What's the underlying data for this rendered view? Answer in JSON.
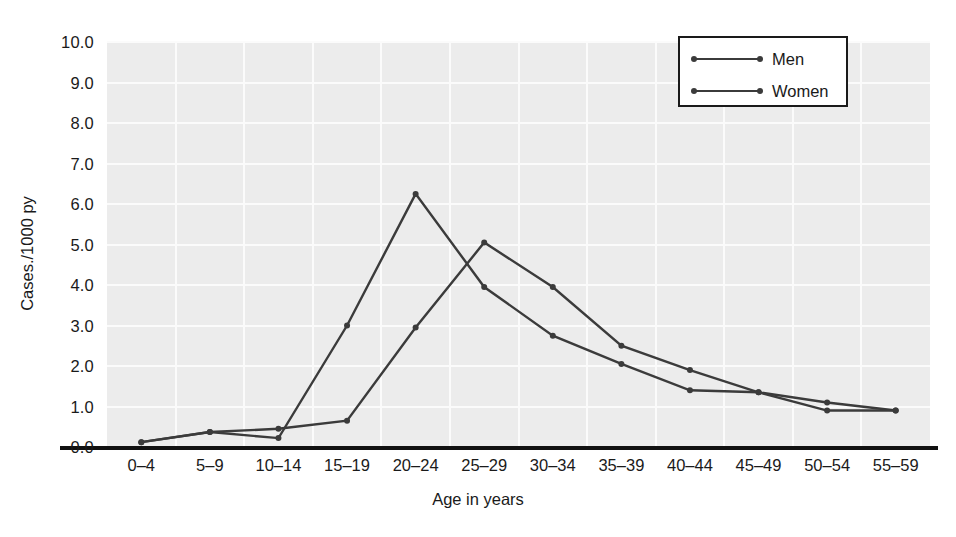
{
  "chart_data": {
    "type": "line",
    "title": "",
    "xlabel": "Age in years",
    "ylabel": "Cases./1000 py",
    "categories": [
      "0–4",
      "5–9",
      "10–14",
      "15–19",
      "20–24",
      "25–29",
      "30–34",
      "35–39",
      "40–44",
      "45–49",
      "50–54",
      "55–59"
    ],
    "ylim": [
      0.0,
      10.0
    ],
    "yticks": [
      "10.0",
      "9.0",
      "8.0",
      "7.0",
      "6.0",
      "5.0",
      "4.0",
      "3.0",
      "2.0",
      "1.0",
      "0.0"
    ],
    "ytick_values": [
      10.0,
      9.0,
      8.0,
      7.0,
      6.0,
      5.0,
      4.0,
      3.0,
      2.0,
      1.0,
      0.0
    ],
    "grid": true,
    "legend_position": "top-right",
    "series": [
      {
        "name": "Men",
        "color": "#3b3b3b",
        "values": [
          0.12,
          0.37,
          0.45,
          0.65,
          2.95,
          5.05,
          3.95,
          2.5,
          1.9,
          1.35,
          1.1,
          0.9
        ]
      },
      {
        "name": "Women",
        "color": "#3b3b3b",
        "values": [
          0.12,
          0.37,
          0.22,
          3.0,
          6.25,
          3.95,
          2.75,
          2.05,
          1.4,
          1.35,
          0.9,
          0.9
        ]
      }
    ]
  },
  "legend": {
    "entries": [
      {
        "label": "Men"
      },
      {
        "label": "Women"
      }
    ]
  },
  "axes": {
    "y_title": "Cases./1000 py",
    "x_title": "Age in years"
  },
  "colors": {
    "plot_background": "#ececec",
    "gridline": "#fbfbfb",
    "line": "#3b3b3b",
    "axis": "#111111",
    "text": "#1a1a1a"
  }
}
